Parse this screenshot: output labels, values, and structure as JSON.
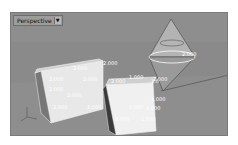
{
  "viewport": {
    "title": "Perspective",
    "menu_icon": "triangle-down-icon",
    "background_color": "#8e8e8e"
  },
  "scene": {
    "objects": [
      "box-left",
      "box-right",
      "double-cone"
    ],
    "dimension_labels": {
      "cone_radius": "2.000",
      "cone_base": "2.000",
      "box_left": [
        "2.000",
        "2.000",
        "2.000",
        "2.000",
        "2.000",
        "2.000",
        "2.000",
        "2.000"
      ],
      "box_right": [
        "1.000",
        "1.000",
        "1.000",
        "1.000",
        "1.000",
        "1.000",
        "2.000",
        "2.000"
      ]
    },
    "axis_icon": "world-axes-icon"
  }
}
